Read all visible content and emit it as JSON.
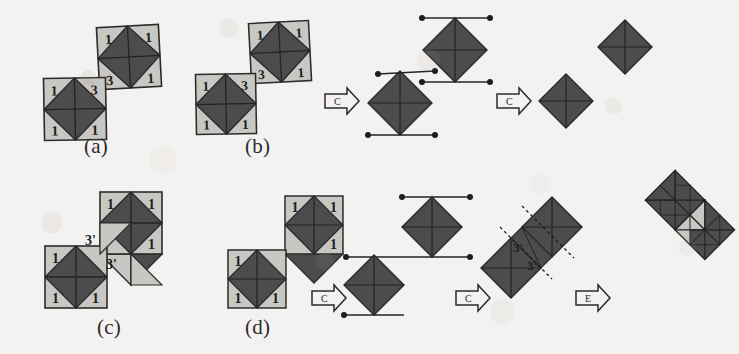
{
  "figure": {
    "background_color": "#f4f2f0",
    "dark_color": "#4c4c4c",
    "light_color": "#c9c7c4",
    "outline_color": "#2b2b2b"
  },
  "panels": [
    {
      "id": "a",
      "caption": "(a)",
      "caption_x": 84,
      "caption_y": 134,
      "description": "Two separate square tiles, each with an inscribed dark octagon-diamond and four light corner triangles labelled with numbers",
      "tiles": [
        {
          "name": "upper-right-tile",
          "x": 98,
          "y": 26,
          "size": 62,
          "rotation": -3,
          "corner_labels": {
            "tl": "1",
            "tr": "1",
            "bl": "3",
            "br": "1"
          }
        },
        {
          "name": "lower-left-tile",
          "x": 44,
          "y": 78,
          "size": 62,
          "rotation": -1,
          "corner_labels": {
            "tl": "1",
            "tr": "3",
            "bl": "1",
            "br": "1"
          }
        }
      ]
    },
    {
      "id": "b",
      "caption": "(b)",
      "caption_x": 245,
      "caption_y": 134,
      "description": "Same two tiles, then two arrow-C reduction steps producing bare diamonds with edge segments and endpoint dots",
      "tiles": [
        {
          "name": "upper-right-tile",
          "x": 250,
          "y": 22,
          "size": 60,
          "rotation": -3,
          "corner_labels": {
            "tl": "1",
            "tr": "1",
            "bl": "3",
            "br": "1"
          }
        },
        {
          "name": "lower-left-tile",
          "x": 196,
          "y": 74,
          "size": 60,
          "rotation": -1,
          "corner_labels": {
            "tl": "1",
            "tr": "3",
            "bl": "1",
            "br": "1"
          }
        }
      ],
      "arrows": [
        {
          "name": "arrow-c-1",
          "label": "C",
          "x": 325,
          "y": 88
        },
        {
          "name": "arrow-c-2",
          "label": "C",
          "x": 497,
          "y": 88
        }
      ],
      "stage_middle": {
        "name": "diamond-pair-with-edges",
        "diamonds": [
          {
            "cx": 455,
            "cy": 50,
            "r": 32
          },
          {
            "cx": 400,
            "cy": 103,
            "r": 32
          }
        ]
      },
      "stage_final": {
        "name": "bare-diamond-pair",
        "diamonds": [
          {
            "cx": 625,
            "cy": 47,
            "r": 27
          },
          {
            "cx": 566,
            "cy": 101,
            "r": 27
          }
        ]
      }
    },
    {
      "id": "c",
      "caption": "(c)",
      "caption_x": 97,
      "caption_y": 315,
      "description": "Two tiles joined edge-to-edge diagonally; the shared band contains two light triangles labelled 3-prime",
      "tiles": [
        {
          "name": "upper-right-tile",
          "x": 100,
          "y": 192,
          "size": 62,
          "rotation": 0,
          "corner_labels": {
            "tl": "1",
            "tr": "1",
            "bl": "",
            "br": "1"
          }
        },
        {
          "name": "lower-left-tile",
          "x": 45,
          "y": 246,
          "size": 62,
          "rotation": 0,
          "corner_labels": {
            "tl": "1",
            "tr": "",
            "bl": "1",
            "br": "1"
          }
        }
      ],
      "joint_labels": [
        {
          "name": "joint-label-upper",
          "text": "3'",
          "x": 92,
          "y": 240
        },
        {
          "name": "joint-label-lower",
          "text": "3'",
          "x": 112,
          "y": 264
        }
      ]
    },
    {
      "id": "d",
      "caption": "(d)",
      "caption_x": 245,
      "caption_y": 315,
      "description": "Joined tile pair reduced by two arrow-C steps to a diamond chain, then arrow-E merges it into a single rotated 1x2 rectangle of triangles",
      "tiles": [
        {
          "name": "upper-right-tile",
          "x": 285,
          "y": 196,
          "size": 58,
          "rotation": 0,
          "corner_labels": {
            "tl": "1",
            "tr": "1",
            "bl": "",
            "br": "1"
          }
        },
        {
          "name": "lower-left-tile",
          "x": 228,
          "y": 250,
          "size": 58,
          "rotation": 0,
          "corner_labels": {
            "tl": "1",
            "tr": "",
            "bl": "1",
            "br": "1"
          }
        }
      ],
      "arrows": [
        {
          "name": "arrow-c-1",
          "label": "C",
          "x": 312,
          "y": 285
        },
        {
          "name": "arrow-c-2",
          "label": "C",
          "x": 456,
          "y": 285
        },
        {
          "name": "arrow-e-1",
          "label": "E",
          "x": 576,
          "y": 285
        }
      ],
      "stage_middle": {
        "name": "diamond-chain-with-edges",
        "diamonds": [
          {
            "cx": 432,
            "cy": 227,
            "r": 30
          },
          {
            "cx": 374,
            "cy": 285,
            "r": 30
          }
        ]
      },
      "stage_dotted": {
        "name": "joined-diamonds-dotted-band",
        "labels": [
          {
            "name": "dotted-label-upper",
            "text": "3'",
            "x": 521,
            "y": 246
          },
          {
            "name": "dotted-label-lower",
            "text": "3'",
            "x": 534,
            "y": 264
          }
        ]
      },
      "stage_final": {
        "name": "merged-rectangle-tile",
        "description": "rotated 1x2 rectangle subdivided into dark and light triangles"
      }
    }
  ]
}
